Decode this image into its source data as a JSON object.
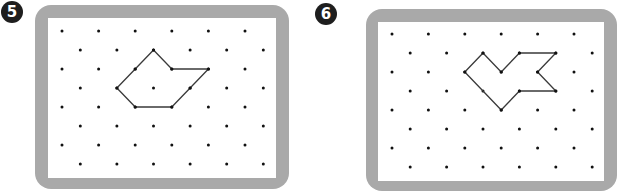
{
  "colors": {
    "frame": "#a9a9a9",
    "paper": "#ffffff",
    "dot": "#111111",
    "line": "#3a3a3a",
    "badge": "#1e1e1e"
  },
  "panels": [
    {
      "number": "5",
      "grid": {
        "rows": 8,
        "even_row_dots": 6,
        "odd_row_dots": 6,
        "offset_rows": "odd"
      },
      "shape_vertices": [
        [
          5,
          1
        ],
        [
          6,
          2
        ],
        [
          8,
          2
        ],
        [
          7,
          3
        ],
        [
          6,
          4
        ],
        [
          4,
          4
        ],
        [
          3,
          3
        ],
        [
          4,
          2
        ]
      ]
    },
    {
      "number": "6",
      "grid": {
        "rows": 8,
        "even_row_dots": 6,
        "odd_row_dots": 6,
        "offset_rows": "odd"
      },
      "shape_vertices": [
        [
          5,
          1
        ],
        [
          6,
          2
        ],
        [
          7,
          1
        ],
        [
          9,
          1
        ],
        [
          8,
          2
        ],
        [
          9,
          3
        ],
        [
          7,
          3
        ],
        [
          6,
          4
        ],
        [
          4,
          2
        ]
      ]
    }
  ]
}
